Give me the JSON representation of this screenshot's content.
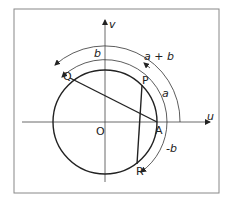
{
  "diagram": {
    "axes": {
      "x_label": "u",
      "y_label": "v"
    },
    "points": {
      "origin": "O",
      "A": "A",
      "P": "P",
      "Q": "Q",
      "R": "R"
    },
    "arc_labels": {
      "a": "a",
      "b": "b",
      "a_plus_b": "a + b",
      "minus_b": "-b"
    },
    "colors": {
      "stroke": "#222222",
      "frame": "#888888",
      "background": "#ffffff"
    }
  }
}
